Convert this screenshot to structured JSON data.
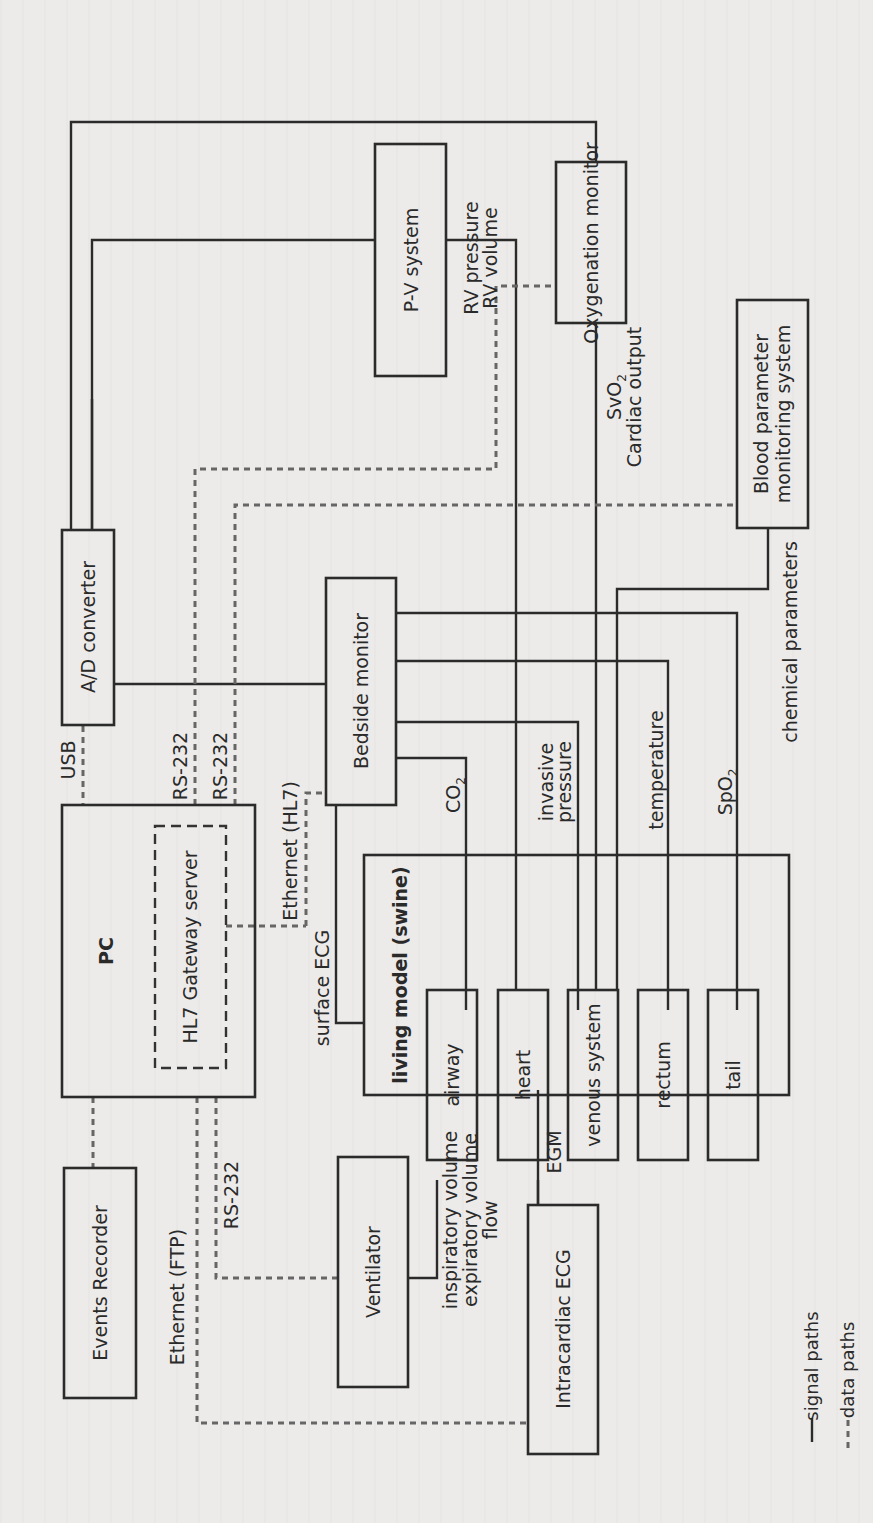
{
  "diagram": {
    "orientation": "rotated 90deg counter-clockwise",
    "colors": {
      "background": "#ecebe9",
      "line": "#2b2b2b",
      "data_line": "#666666"
    },
    "blocks": {
      "pv_system": "P-V system",
      "oxygenation_monitor": "Oxygenation monitor",
      "blood_parameter_line1": "Blood parameter",
      "blood_parameter_line2": "monitoring system",
      "ad_converter": "A/D converter",
      "bedside_monitor": "Bedside monitor",
      "pc": "PC",
      "hl7_gateway": "HL7 Gateway server",
      "living_model": "living model (swine)",
      "airway": "airway",
      "heart": "heart",
      "venous_system": "venous system",
      "rectum": "rectum",
      "tail": "tail",
      "events_recorder": "Events Recorder",
      "ventilator": "Ventilator",
      "intracardiac_ecg": "Intracardiac ECG"
    },
    "signal_labels": {
      "rv_pressure": "RV pressure",
      "rv_volume": "RV volume",
      "svo2_base": "SvO",
      "svo2_sub": "2",
      "cardiac_output": "Cardiac output",
      "chemical_parameters": "chemical parameters",
      "co2_base": "CO",
      "co2_sub": "2",
      "invasive": "invasive",
      "pressure": "pressure",
      "temperature": "temperature",
      "spo2_base": "SpO",
      "spo2_sub": "2",
      "surface_ecg": "surface ECG",
      "inspiratory_volume": "inspiratory volume",
      "expiratory_volume": "expiratory volume",
      "flow": "flow",
      "egm": "EGM"
    },
    "data_labels": {
      "usb": "USB",
      "rs232_a": "RS-232",
      "rs232_b": "RS-232",
      "ethernet_hl7": "Ethernet (HL7)",
      "ethernet_ftp": "Ethernet (FTP)",
      "rs232_ventilator": "RS-232"
    },
    "legend": {
      "signal_paths": "signal paths",
      "data_paths": "data paths"
    }
  }
}
